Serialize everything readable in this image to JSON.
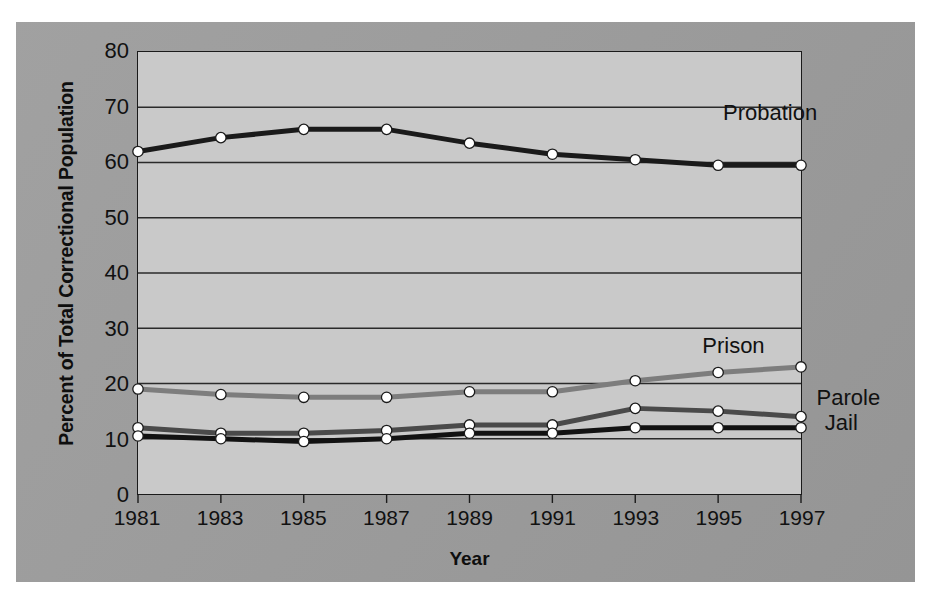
{
  "chart_data": {
    "type": "line",
    "title": "",
    "xlabel": "Year",
    "ylabel": "Percent of Total Correctional Population",
    "x": [
      1981,
      1983,
      1985,
      1987,
      1989,
      1991,
      1993,
      1995,
      1997
    ],
    "xtick_labels": [
      "1981",
      "1983",
      "1985",
      "1987",
      "1989",
      "1991",
      "1993",
      "1995",
      "1997"
    ],
    "ytick_labels": [
      "0",
      "10",
      "20",
      "30",
      "40",
      "50",
      "60",
      "70",
      "80"
    ],
    "yticks": [
      0,
      10,
      20,
      30,
      40,
      50,
      60,
      70,
      80
    ],
    "ylim": [
      0,
      80
    ],
    "xlim": [
      1981,
      1997
    ],
    "grid": "horizontal",
    "legend_position": "inline-right-of-series",
    "markers": "white filled circles with dark outline",
    "series": [
      {
        "name": "Probation",
        "label": "Probation",
        "color": "#1a1a1a",
        "values": [
          62,
          64.5,
          66,
          66,
          63.5,
          61.5,
          60.5,
          59.5,
          59.5
        ],
        "label_x": 1995.1,
        "label_y": 68.5
      },
      {
        "name": "Prison",
        "label": "Prison",
        "color": "#7d7d7d",
        "values": [
          19,
          18,
          17.5,
          17.5,
          18.5,
          18.5,
          20.5,
          22,
          23
        ],
        "label_x": 1994.6,
        "label_y": 26.5
      },
      {
        "name": "Parole",
        "label": "Parole",
        "color": "#4a4a4a",
        "values": [
          12,
          11,
          11,
          11.5,
          12.5,
          12.5,
          15.5,
          15,
          14
        ],
        "label_x": 1997.35,
        "label_y": 17.2
      },
      {
        "name": "Jail",
        "label": "Jail",
        "color": "#121212",
        "values": [
          10.5,
          10,
          9.5,
          10,
          11,
          11,
          12,
          12,
          12
        ],
        "label_x": 1997.55,
        "label_y": 12.6
      }
    ]
  },
  "colors": {
    "panel_background": "#9d9d9d",
    "plot_background": "#c9c9c9",
    "axis": "#1a1a1a",
    "gridline": "#2a2a2a",
    "marker_fill": "#ffffff",
    "marker_edge": "#1a1a1a"
  }
}
